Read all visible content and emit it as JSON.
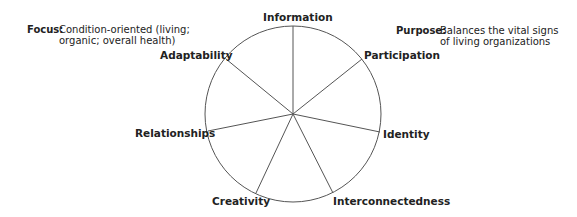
{
  "focus": {
    "key": "Focus:",
    "line1": "Condition-oriented (living;",
    "line2": "organic; overall health)"
  },
  "purpose": {
    "key": "Purpose:",
    "line1": "Balances the vital signs",
    "line2": "of living organizations"
  },
  "wheel": {
    "center": [
      293,
      114
    ],
    "radius": 88,
    "segments": [
      {
        "label": "Information",
        "spoke_end": [
          293,
          26
        ]
      },
      {
        "label": "Participation",
        "spoke_end": [
          362,
          59
        ]
      },
      {
        "label": "Identity",
        "spoke_end": [
          380,
          132
        ]
      },
      {
        "label": "Interconnectedness",
        "spoke_end": [
          333,
          193
        ]
      },
      {
        "label": "Creativity",
        "spoke_end": [
          256,
          193
        ]
      },
      {
        "label": "Relationships",
        "spoke_end": [
          208,
          131
        ]
      },
      {
        "label": "Adaptability",
        "spoke_end": [
          226,
          59
        ]
      }
    ]
  },
  "colors": {
    "text": "#222222",
    "line": "#555555"
  }
}
